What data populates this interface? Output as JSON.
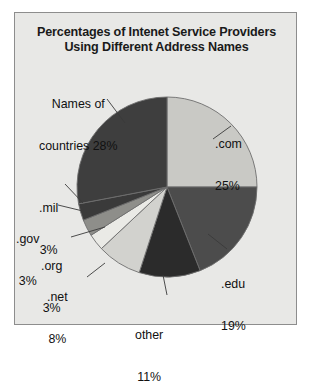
{
  "chart_data": {
    "type": "pie",
    "title": "Percentages of Intenet Service Providers Using Different Address Names",
    "title_line1": "Percentages of Intenet Service Providers",
    "title_line2": "Using Different Address Names",
    "xlabel": "",
    "ylabel": "",
    "legend": "none",
    "grid": false,
    "units": "percent",
    "total": 100,
    "categories": [
      "Names of countries",
      ".com",
      ".edu",
      "other",
      ".net",
      ".org",
      ".gov",
      ".mil"
    ],
    "values": [
      28,
      25,
      19,
      11,
      8,
      3,
      3,
      3
    ],
    "slices": [
      {
        "name": "com",
        "label_line1": ".com",
        "label_line2": "25%",
        "value": 25,
        "color": "#c9c9c5",
        "start_deg": 0,
        "end_deg": 90,
        "label_x": 200,
        "label_y": 96,
        "align": "left"
      },
      {
        "name": "edu",
        "label_line1": ".edu",
        "label_line2": "19%",
        "value": 19,
        "color": "#4c4c4c",
        "start_deg": 90,
        "end_deg": 158.4,
        "label_x": 206,
        "label_y": 236,
        "align": "left"
      },
      {
        "name": "other",
        "label_line1": "other",
        "label_line2": "11%",
        "value": 11,
        "color": "#2b2b2b",
        "start_deg": 158.4,
        "end_deg": 198,
        "label_x": 120,
        "label_y": 287,
        "align": "center"
      },
      {
        "name": "net",
        "label_line1": ".net",
        "label_line2": "8%",
        "value": 8,
        "color": "#d2d2ce",
        "start_deg": 198,
        "end_deg": 226.8,
        "label_x": 32,
        "label_y": 249,
        "align": "center"
      },
      {
        "name": "org",
        "label_line1": ".org",
        "label_line2": "3%",
        "value": 3,
        "color": "#eaeae6",
        "start_deg": 226.8,
        "end_deg": 237.6,
        "label_x": 26,
        "label_y": 218,
        "align": "center"
      },
      {
        "name": "gov",
        "label_line1": ".gov",
        "label_line2": "3%",
        "value": 3,
        "color": "#8e8e8a",
        "start_deg": 237.6,
        "end_deg": 248.4,
        "label_x": 1,
        "label_y": 191,
        "align": "center"
      },
      {
        "name": "mil",
        "label_line1": ".mil",
        "label_line2": "3%",
        "value": 3,
        "color": "#3a3a3a",
        "start_deg": 248.4,
        "end_deg": 259.2,
        "label_x": 24,
        "label_y": 160,
        "align": "center"
      },
      {
        "name": "countries",
        "label_line1": "Names of",
        "label_line2": "countries 28%",
        "value": 28,
        "color": "#3e3e3e",
        "start_deg": 259.2,
        "end_deg": 360,
        "label_x": 24,
        "label_y": 56,
        "align": "center"
      }
    ],
    "geometry": {
      "cx": 152,
      "cy": 174,
      "r": 90,
      "stroke": "#6e6e6e"
    },
    "leaders": [
      {
        "name": "leader-com",
        "x1": 198,
        "y1": 126,
        "x2": 216,
        "y2": 113
      },
      {
        "name": "leader-edu",
        "x1": 193,
        "y1": 221,
        "x2": 212,
        "y2": 236
      },
      {
        "name": "leader-other",
        "x1": 148,
        "y1": 262,
        "x2": 152,
        "y2": 282
      },
      {
        "name": "leader-net",
        "x1": 90,
        "y1": 250,
        "x2": 72,
        "y2": 264
      },
      {
        "name": "leader-org",
        "x1": 90,
        "y1": 214,
        "x2": 56,
        "y2": 224
      },
      {
        "name": "leader-gov",
        "x1": 72,
        "y1": 199,
        "x2": 43,
        "y2": 192
      },
      {
        "name": "leader-mil",
        "x1": 68,
        "y1": 190,
        "x2": 50,
        "y2": 171
      },
      {
        "name": "leader-countries",
        "x1": 110,
        "y1": 110,
        "x2": 92,
        "y2": 86
      }
    ]
  }
}
